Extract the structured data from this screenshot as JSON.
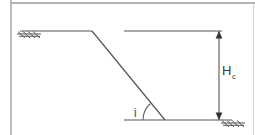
{
  "figure": {
    "type": "engineering-diagram",
    "background_color": "#ffffff",
    "line_color": "#555555",
    "frame_color": "#9a9a9a",
    "labels": {
      "height_symbol": "H",
      "height_subscript": "c",
      "angle_symbol": "i"
    },
    "geometry": {
      "upper_terrace": {
        "name": "upper-ground-surface",
        "x1": 20,
        "y1": 31,
        "x2": 92,
        "y2": 31
      },
      "slope_face": {
        "name": "slope-face",
        "x1": 92,
        "y1": 31,
        "x2": 165,
        "y2": 120,
        "angle_label": "i"
      },
      "toe_line": {
        "name": "lower-ground-surface",
        "x1": 124,
        "y1": 120,
        "x2": 232,
        "y2": 120
      },
      "crest_reference_line": {
        "name": "crest-reference-line",
        "x1": 124,
        "y1": 31,
        "x2": 222,
        "y2": 31
      },
      "dimension_line": {
        "name": "height-dimension-line",
        "x": 219,
        "y_top": 31,
        "y_bottom": 120,
        "value_label": "H_c"
      },
      "angle_arc": {
        "name": "slope-angle-arc",
        "vertex_x": 165,
        "vertex_y": 120,
        "radius": 22
      },
      "hatch_left": {
        "name": "ground-hatch-left",
        "x": 18,
        "y": 31
      },
      "hatch_right": {
        "name": "ground-hatch-right",
        "x": 222,
        "y": 120
      }
    },
    "frame": {
      "left_border_x": 11,
      "top_border_y": 3
    }
  }
}
